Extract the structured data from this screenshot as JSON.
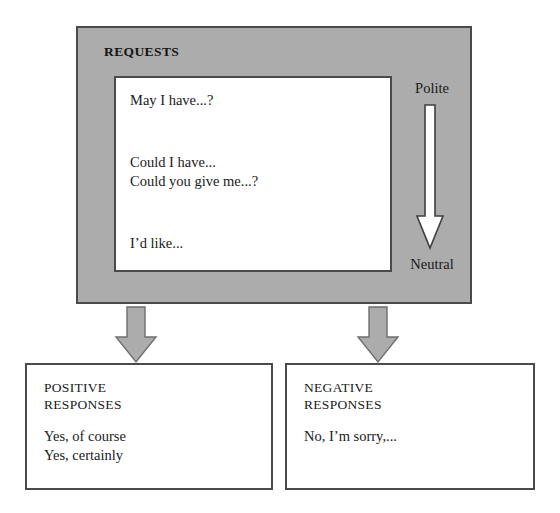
{
  "diagram": {
    "title": "REQUESTS",
    "panel_color": "#acacac",
    "border_color": "#4a4a4a",
    "requests": {
      "label": "REQUESTS",
      "phrases": [
        "May I have...?",
        "Could I have...",
        "Could you give me...?",
        "I’d like..."
      ]
    },
    "politeness_scale": {
      "top_label": "Polite",
      "bottom_label": "Neutral",
      "arrow_direction": "down",
      "arrow_fill": "#ffffff",
      "arrow_stroke": "#4a4a4a"
    },
    "connectors": [
      {
        "name": "to-positive",
        "direction": "down",
        "fill": "#acacac",
        "stroke": "#6e6e6e"
      },
      {
        "name": "to-negative",
        "direction": "down",
        "fill": "#acacac",
        "stroke": "#6e6e6e"
      }
    ],
    "responses": [
      {
        "heading": "POSITIVE\nRESPONSES",
        "examples": "Yes, of course\nYes, certainly"
      },
      {
        "heading": "NEGATIVE\nRESPONSES",
        "examples": "No, I’m sorry,..."
      }
    ]
  }
}
